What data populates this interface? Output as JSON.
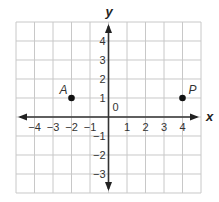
{
  "chart_data": {
    "type": "scatter",
    "title": "",
    "xlabel": "x",
    "ylabel": "y",
    "xlim": [
      -5,
      5
    ],
    "ylim": [
      -4,
      5
    ],
    "grid": true,
    "x_ticks": [
      "−4",
      "−3",
      "−2",
      "−1",
      "1",
      "2",
      "3",
      "4"
    ],
    "y_ticks": [
      "4",
      "3",
      "2",
      "1",
      "−1",
      "−2",
      "−3"
    ],
    "origin_label": "0",
    "points": [
      {
        "label": "A",
        "x": -2,
        "y": 1
      },
      {
        "label": "P",
        "x": 4,
        "y": 1
      }
    ]
  }
}
